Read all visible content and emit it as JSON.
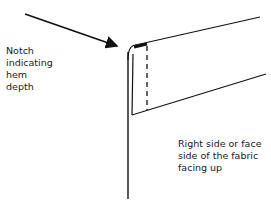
{
  "diagram": {
    "labels": {
      "notch": "Notch\nindicating\nhem\ndepth",
      "face": "Right side or face\nside of the fabric\nfacing up"
    },
    "colors": {
      "line": "#111111",
      "background": "#ffffff"
    },
    "elements": [
      "arrow pointing to notch",
      "fabric edge (vertical line)",
      "folded hem panel",
      "dashed hem depth line",
      "notch mark"
    ]
  }
}
